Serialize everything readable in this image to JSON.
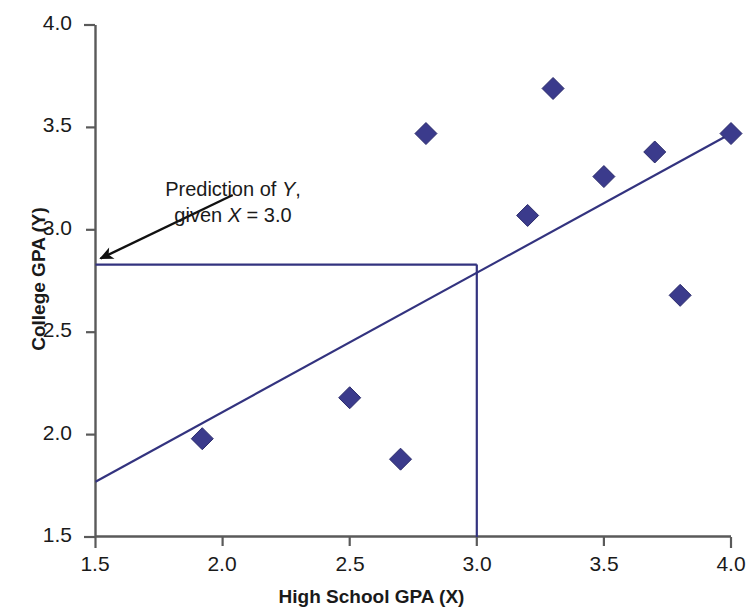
{
  "chart_data": {
    "type": "scatter",
    "title": "",
    "xlabel": "High School GPA (X)",
    "ylabel": "College GPA (Y)",
    "xlim": [
      1.5,
      4.0
    ],
    "ylim": [
      1.5,
      4.0
    ],
    "xticks": [
      "1.5",
      "2.0",
      "2.5",
      "3.0",
      "3.5",
      "4.0"
    ],
    "yticks": [
      "1.5",
      "2.0",
      "2.5",
      "3.0",
      "3.5",
      "4.0"
    ],
    "xtick_values": [
      1.5,
      2.0,
      2.5,
      3.0,
      3.5,
      4.0
    ],
    "ytick_values": [
      1.5,
      2.0,
      2.5,
      3.0,
      3.5,
      4.0
    ],
    "grid": false,
    "legend": "none",
    "marker": "diamond",
    "marker_color": "#3b3b8c",
    "line_color": "#33337f",
    "axis_color": "#5a5a5a",
    "points": [
      {
        "x": 1.92,
        "y": 1.98
      },
      {
        "x": 2.5,
        "y": 2.18
      },
      {
        "x": 2.7,
        "y": 1.88
      },
      {
        "x": 2.8,
        "y": 3.47
      },
      {
        "x": 3.2,
        "y": 3.07
      },
      {
        "x": 3.3,
        "y": 3.69
      },
      {
        "x": 3.5,
        "y": 3.26
      },
      {
        "x": 3.7,
        "y": 3.38
      },
      {
        "x": 3.8,
        "y": 2.68
      },
      {
        "x": 4.0,
        "y": 3.47
      }
    ],
    "regression_line": {
      "name": "Regression line",
      "x_start": 1.5,
      "y_start": 1.77,
      "x_end": 4.0,
      "y_end": 3.47
    },
    "prediction": {
      "x": 3.0,
      "y": 2.83,
      "horizontal_segment": {
        "x_start": 1.5,
        "x_end": 3.0,
        "y": 2.83
      },
      "vertical_segment": {
        "x": 3.0,
        "y_start": 1.5,
        "y_end": 2.83
      }
    },
    "annotation": {
      "line1_pre": "Prediction of ",
      "line1_var": "Y",
      "line1_post": ",",
      "line2_pre": "given ",
      "line2_var": "X",
      "line2_post": " = 3.0",
      "arrow_from": {
        "x": 2.04,
        "y": 3.17
      },
      "arrow_to": {
        "x": 1.52,
        "y": 2.86
      }
    }
  }
}
